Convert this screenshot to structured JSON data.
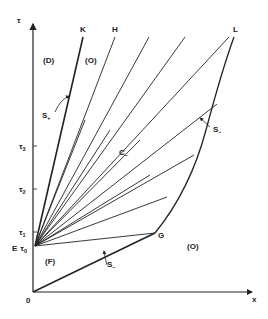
{
  "diagram": {
    "type": "characteristic fan diagram (x-τ plane)",
    "axes": {
      "x_label": "x",
      "y_label": "τ",
      "origin_label": "0",
      "y_ticks": [
        {
          "label": "τ",
          "sub": "3",
          "y": 146
        },
        {
          "label": "τ",
          "sub": "2",
          "y": 189
        },
        {
          "label": "τ",
          "sub": "1",
          "y": 232
        }
      ],
      "tau0": {
        "prefix": "E",
        "label": "τ",
        "sub": "0"
      }
    },
    "regions": {
      "D": "(D)",
      "O_upper": "(O)",
      "O_lower": "(O)",
      "F": "(F)"
    },
    "points": {
      "K": "K",
      "H": "H",
      "L": "L",
      "G": "G",
      "E": "E"
    },
    "curves": {
      "s_plus": {
        "label": "S",
        "sub": "+"
      },
      "s_minus_upper": {
        "label": "S",
        "sub": "–"
      },
      "s_minus_lower": {
        "label": "S",
        "sub": "–"
      },
      "c_minus": {
        "label": "C",
        "sub": "–"
      }
    },
    "colors": {
      "line": "#222222",
      "background": "#ffffff"
    }
  }
}
